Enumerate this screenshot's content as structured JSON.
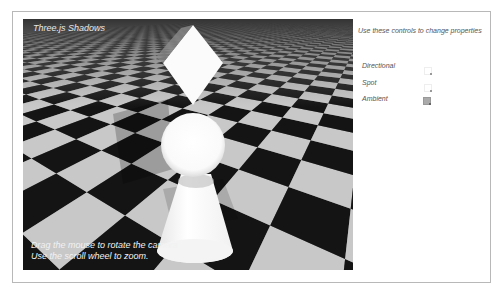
{
  "scene": {
    "title": "Three.js Shadows",
    "help_lines": [
      "Drag the mouse to rotate the camera",
      "Use the scroll wheel to zoom."
    ],
    "objects": [
      "cube",
      "sphere",
      "cone"
    ],
    "floor": "checkerboard"
  },
  "controls": {
    "heading": "Use these controls to change properties",
    "items": [
      {
        "label": "Directional",
        "checked": false
      },
      {
        "label": "Spot",
        "checked": false
      },
      {
        "label": "Ambient",
        "checked": true
      }
    ]
  },
  "colors": {
    "dark_tile": "#141414",
    "light_tile": "#c8c8c8",
    "object": "#ffffff",
    "text": "#555555"
  }
}
